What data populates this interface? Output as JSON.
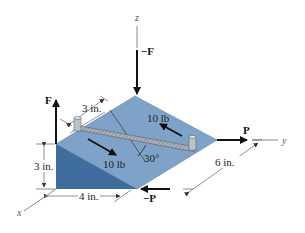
{
  "diagram": {
    "type": "3D statics diagram - inclined block with bar and couple forces",
    "colors": {
      "top_face": "#7fa3c8",
      "side_face": "#3f6d9e",
      "arrow": "#111111",
      "dim_line": "#444444",
      "bar": "#9aa4ae"
    },
    "axes": {
      "z": "z",
      "y": "y",
      "x": "x"
    },
    "forces": {
      "neg_F": "−F",
      "F": "F",
      "P": "P",
      "neg_P": "−P",
      "force_upper": "10 lb",
      "force_lower": "10 lb"
    },
    "dimensions": {
      "pin_offset": "3 in.",
      "height": "3 in.",
      "width": "4 in.",
      "length": "6 in.",
      "angle": "30°"
    }
  }
}
